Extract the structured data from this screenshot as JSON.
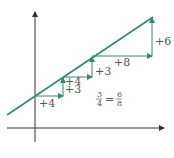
{
  "diagram": {
    "type": "slope-triangles",
    "colors": {
      "line": "#2e8b6e",
      "arrows": "#2e8b6e",
      "axes": "#333333",
      "text": "#555555"
    },
    "labels": {
      "run1": "+4",
      "rise1": "+3",
      "run2": "+4",
      "rise2": "+3",
      "run3": "+8",
      "rise3": "+6"
    },
    "equation": {
      "left_num": "3",
      "left_den": "4",
      "equals": "=",
      "right_num": "6",
      "right_den": "8"
    }
  }
}
